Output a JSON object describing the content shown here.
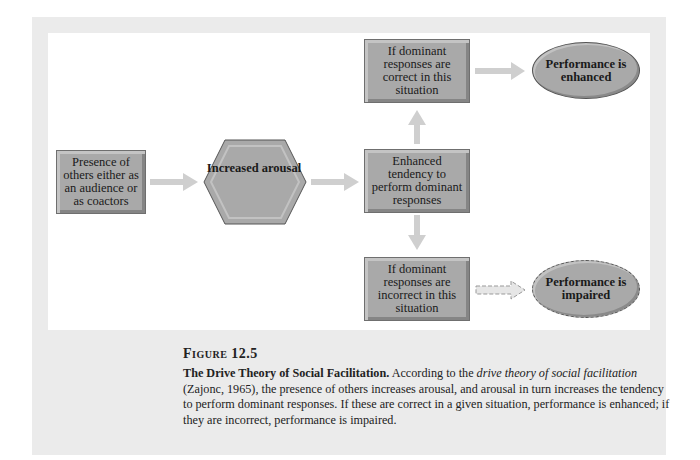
{
  "diagram": {
    "nodes": {
      "presence": {
        "label": "Presence of others either as an audience or as coactors",
        "shape": "rectangle"
      },
      "arousal": {
        "label": "Increased arousal",
        "shape": "hexagon"
      },
      "tendency": {
        "label": "Enhanced tendency to perform dominant responses",
        "shape": "rectangle"
      },
      "correct": {
        "label": "If dominant responses are correct in this situation",
        "shape": "rectangle"
      },
      "incorrect": {
        "label": "If dominant responses are incorrect in this situation",
        "shape": "rectangle"
      },
      "enhanced": {
        "label": "Performance is enhanced",
        "shape": "ellipse"
      },
      "impaired": {
        "label": "Performance is impaired",
        "shape": "ellipse-dashed"
      }
    },
    "edges": [
      {
        "from": "presence",
        "to": "arousal",
        "style": "solid"
      },
      {
        "from": "arousal",
        "to": "tendency",
        "style": "solid"
      },
      {
        "from": "tendency",
        "to": "correct",
        "style": "solid"
      },
      {
        "from": "tendency",
        "to": "incorrect",
        "style": "solid"
      },
      {
        "from": "correct",
        "to": "enhanced",
        "style": "solid"
      },
      {
        "from": "incorrect",
        "to": "impaired",
        "style": "dashed"
      }
    ],
    "colors": {
      "node_fill": "#a9a9a9",
      "arrow": "#cfcfcf",
      "panel": "#ebebeb",
      "background": "#ffffff"
    }
  },
  "caption": {
    "figure_label": "Figure 12.5",
    "title": "The Drive Theory of Social Facilitation.",
    "text_1": " According to the ",
    "italic_1": "drive theory of social facilitation",
    "text_2": " (Zajonc, 1965), the presence of others increases arousal, and arousal in turn increases the tendency to perform dominant responses. If these are correct in a given situation, performance is enhanced; if they are incorrect, performance is impaired."
  }
}
